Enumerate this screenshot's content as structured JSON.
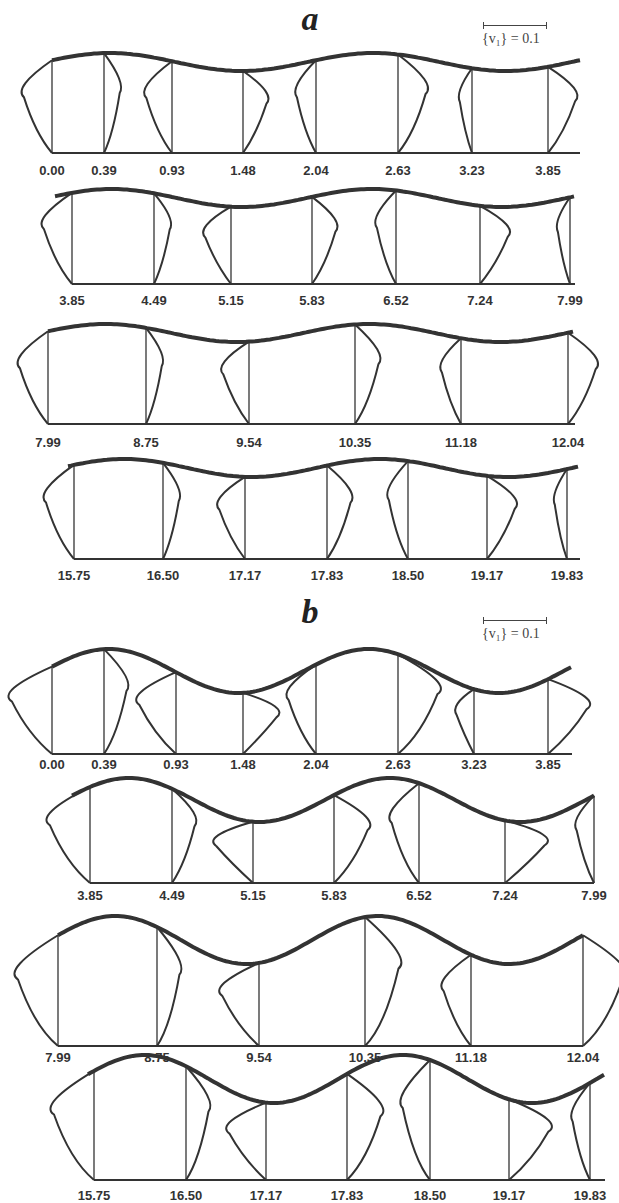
{
  "figure": {
    "panels": [
      {
        "letter": "a",
        "scale_label": "{v₁} = 0.1",
        "rows": [
          {
            "ticks": [
              "0.00",
              "0.39",
              "0.93",
              "1.48",
              "2.04",
              "2.63",
              "3.23",
              "3.85"
            ]
          },
          {
            "ticks": [
              "3.85",
              "4.49",
              "5.15",
              "5.83",
              "6.52",
              "7.24",
              "7.99"
            ]
          },
          {
            "ticks": [
              "7.99",
              "8.75",
              "9.54",
              "10.35",
              "11.18",
              "12.04"
            ]
          },
          {
            "ticks": [
              "15.75",
              "16.50",
              "17.17",
              "17.83",
              "18.50",
              "19.17",
              "19.83"
            ]
          }
        ]
      },
      {
        "letter": "b",
        "scale_label": "{v₁} = 0.1",
        "rows": [
          {
            "ticks": [
              "0.00",
              "0.39",
              "0.93",
              "1.48",
              "2.04",
              "2.63",
              "3.23",
              "3.85"
            ]
          },
          {
            "ticks": [
              "3.85",
              "4.49",
              "5.15",
              "5.83",
              "6.52",
              "7.24",
              "7.99"
            ]
          },
          {
            "ticks": [
              "7.99",
              "8.75",
              "9.54",
              "10.35",
              "11.18",
              "12.04"
            ]
          },
          {
            "ticks": [
              "15.75",
              "16.50",
              "17.17",
              "17.83",
              "18.50",
              "19.17",
              "19.83"
            ]
          }
        ]
      }
    ]
  },
  "chart_data": {
    "type": "line",
    "scale_bar": "{v₁} = 0.1",
    "panels": {
      "a": {
        "wall_amplitude": "small",
        "stations": [
          [
            0.0,
            0.39,
            0.93,
            1.48,
            2.04,
            2.63,
            3.23,
            3.85
          ],
          [
            3.85,
            4.49,
            5.15,
            5.83,
            6.52,
            7.24,
            7.99
          ],
          [
            7.99,
            8.75,
            9.54,
            10.35,
            11.18,
            12.04
          ],
          [
            15.75,
            16.5,
            17.17,
            17.83,
            18.5,
            19.17,
            19.83
          ]
        ]
      },
      "b": {
        "wall_amplitude": "large",
        "stations": [
          [
            0.0,
            0.39,
            0.93,
            1.48,
            2.04,
            2.63,
            3.23,
            3.85
          ],
          [
            3.85,
            4.49,
            5.15,
            5.83,
            6.52,
            7.24,
            7.99
          ],
          [
            7.99,
            8.75,
            9.54,
            10.35,
            11.18,
            12.04
          ],
          [
            15.75,
            16.5,
            17.17,
            17.83,
            18.5,
            19.17,
            19.83
          ]
        ]
      }
    }
  }
}
